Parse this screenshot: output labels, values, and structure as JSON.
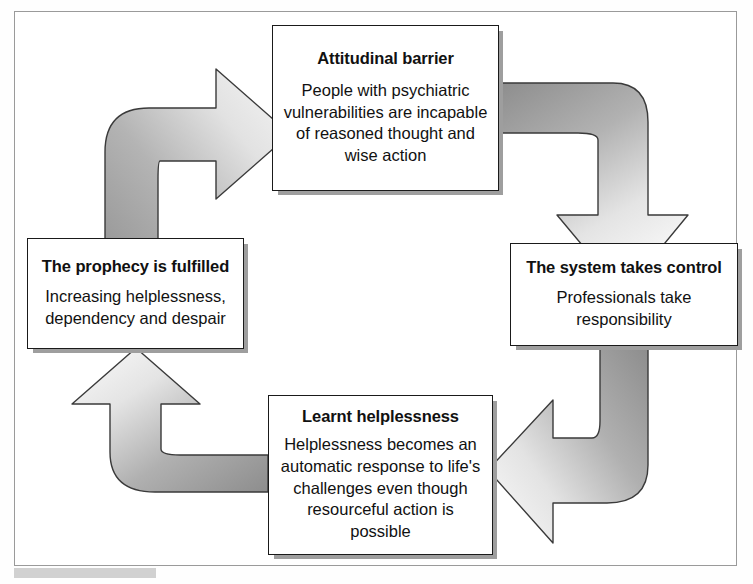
{
  "diagram": {
    "type": "cycle-diagram",
    "colors": {
      "box_fill": "#ffffff",
      "box_border": "#1a1a1a",
      "box_shadow": "#9e9e9e",
      "arrow_dark": "#9b9b9b",
      "arrow_light": "#f2f2f2",
      "arrow_outline": "#3a3a3a",
      "frame_border": "#9a9a9a",
      "text": "#111111"
    },
    "nodes": [
      {
        "id": "attitudinal-barrier",
        "position": "top",
        "title": "Attitudinal barrier",
        "body": "People with psychiatric vulnerabilities are incapable of reasoned thought and wise action"
      },
      {
        "id": "system-takes-control",
        "position": "right",
        "title": "The system takes control",
        "body": "Professionals take responsibility"
      },
      {
        "id": "learnt-helplessness",
        "position": "bottom",
        "title": "Learnt helplessness",
        "body": "Helplessness becomes an automatic response to life's challenges even though resourceful action is possible"
      },
      {
        "id": "prophecy-is-fulfilled",
        "position": "left",
        "title": "The prophecy is fulfilled",
        "body": "Increasing helplessness, dependency and despair"
      }
    ],
    "arrows": [
      {
        "id": "arrow-left-to-top",
        "from": "prophecy-is-fulfilled",
        "to": "attitudinal-barrier",
        "direction": "up-then-right"
      },
      {
        "id": "arrow-top-to-right",
        "from": "attitudinal-barrier",
        "to": "system-takes-control",
        "direction": "right-then-down"
      },
      {
        "id": "arrow-right-to-bottom",
        "from": "system-takes-control",
        "to": "learnt-helplessness",
        "direction": "down-then-left"
      },
      {
        "id": "arrow-bottom-to-left",
        "from": "learnt-helplessness",
        "to": "prophecy-is-fulfilled",
        "direction": "left-then-up"
      }
    ]
  }
}
